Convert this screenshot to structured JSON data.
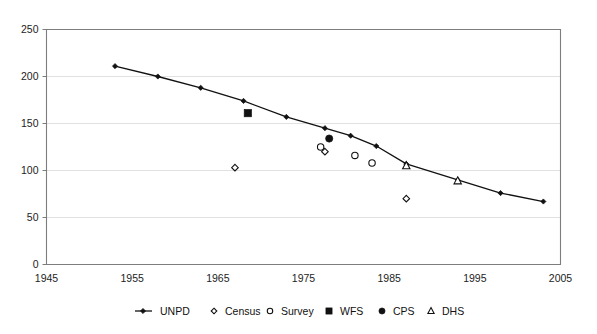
{
  "chart_data": {
    "type": "scatter",
    "title": "",
    "subtitle": "",
    "xlabel": "",
    "ylabel": "",
    "xlim": [
      1945,
      2005
    ],
    "ylim": [
      0,
      250
    ],
    "xticks": [
      1945,
      1955,
      1965,
      1975,
      1985,
      1995,
      2005
    ],
    "xtick_labels": [
      "1945",
      "1955",
      "1965",
      "1975",
      "1985",
      "1995",
      "2005"
    ],
    "yticks": [
      0,
      50,
      100,
      150,
      200,
      250
    ],
    "ytick_labels": [
      "0",
      "50",
      "100",
      "150",
      "200",
      "250"
    ],
    "grid": "horizontal",
    "legend_position": "bottom",
    "plot_background": "#ffffff",
    "axis_color": "#7d7d7d",
    "grid_color": "#d9d9d9",
    "marker_color": "#111111",
    "series": [
      {
        "name": "UNPD",
        "marker": "line-diamond",
        "filled": true,
        "x": [
          1953,
          1958,
          1963,
          1968,
          1973,
          1977.5,
          1980.5,
          1983.5,
          1987,
          1993,
          1998,
          2003
        ],
        "y": [
          211,
          200,
          188,
          174,
          157,
          145,
          137,
          126,
          107,
          90,
          76,
          67
        ]
      },
      {
        "name": "Census",
        "marker": "open-diamond",
        "filled": false,
        "x": [
          1967,
          1977.5,
          1987
        ],
        "y": [
          103,
          120,
          70
        ]
      },
      {
        "name": "Survey",
        "marker": "open-circle",
        "filled": false,
        "x": [
          1977,
          1981,
          1983
        ],
        "y": [
          125,
          116,
          108
        ]
      },
      {
        "name": "WFS",
        "marker": "filled-square",
        "filled": true,
        "x": [
          1968.5
        ],
        "y": [
          161
        ]
      },
      {
        "name": "CPS",
        "marker": "filled-circle",
        "filled": true,
        "x": [
          1978
        ],
        "y": [
          134
        ]
      },
      {
        "name": "DHS",
        "marker": "open-triangle",
        "filled": false,
        "x": [
          1987,
          1993
        ],
        "y": [
          105,
          89
        ]
      }
    ],
    "legend_entries": [
      {
        "label": "UNPD",
        "marker": "line-diamond"
      },
      {
        "label": "Census",
        "marker": "open-diamond"
      },
      {
        "label": "Survey",
        "marker": "open-circle"
      },
      {
        "label": "WFS",
        "marker": "filled-square"
      },
      {
        "label": "CPS",
        "marker": "filled-circle"
      },
      {
        "label": "DHS",
        "marker": "open-triangle"
      }
    ]
  }
}
